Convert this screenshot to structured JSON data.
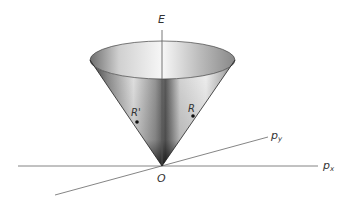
{
  "diagram": {
    "type": "energy-momentum light cone",
    "axes": {
      "vertical": {
        "label": "E"
      },
      "x": {
        "label": "p",
        "subscript": "x"
      },
      "y": {
        "label": "p",
        "subscript": "y"
      },
      "origin": {
        "label": "O"
      }
    },
    "points": [
      {
        "label": "R'",
        "x": 137,
        "y": 122
      },
      {
        "label": "R",
        "x": 193,
        "y": 116
      }
    ],
    "colors": {
      "background": "#ffffff",
      "axis": "#555555",
      "cone_dark": "#2a2a2a",
      "cone_light": "#f2f2f2",
      "point": "#111111"
    }
  }
}
